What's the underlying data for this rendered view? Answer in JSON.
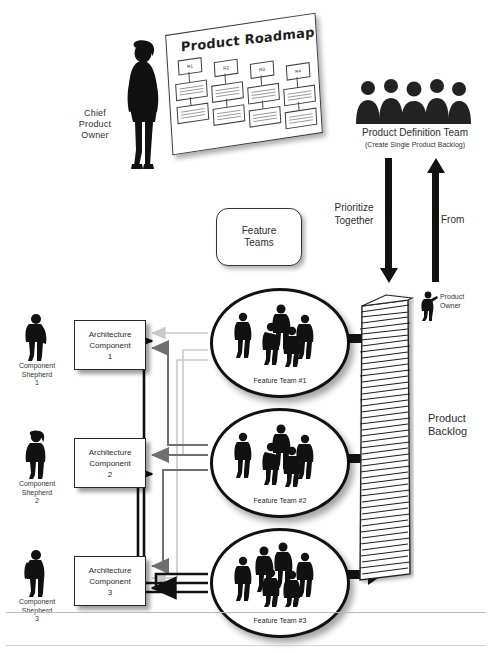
{
  "diagram": {
    "title_text": "Product Roadmap",
    "roadmap": {
      "releases": [
        "R1",
        "R2",
        "R3",
        "R4"
      ]
    },
    "chief_product_owner": {
      "label_line1": "Chief",
      "label_line2": "Product",
      "label_line3": "Owner"
    },
    "product_definition_team": {
      "label": "Product Definition Team",
      "sublabel": "(Create Single Product Backlog)"
    },
    "flow_labels": {
      "prioritize_line1": "Prioritize",
      "prioritize_line2": "Together",
      "from": "From"
    },
    "feature_teams_box": {
      "line1": "Feature",
      "line2": "Teams"
    },
    "feature_teams": [
      {
        "name": "Feature Team #1"
      },
      {
        "name": "Feature Team #2"
      },
      {
        "name": "Feature Team #3"
      }
    ],
    "architecture_components": [
      {
        "line1": "Architecture",
        "line2": "Component",
        "line3": "1"
      },
      {
        "line1": "Architecture",
        "line2": "Component",
        "line3": "2"
      },
      {
        "line1": "Architecture",
        "line2": "Component",
        "line3": "3"
      }
    ],
    "component_shepherds": [
      {
        "line1": "Component",
        "line2": "Shepherd",
        "line3": "1"
      },
      {
        "line1": "Component",
        "line2": "Shepherd",
        "line3": "2"
      },
      {
        "line1": "Component",
        "line2": "Shepherd",
        "line3": "3"
      }
    ],
    "product_backlog": {
      "label_line1": "Product",
      "label_line2": "Backlog"
    },
    "product_owner": {
      "label_line1": "Product",
      "label_line2": "Owner"
    },
    "colors": {
      "ink": "#111111",
      "paper": "#ffffff",
      "wire_light": "#c9c9c9",
      "wire_mid": "#6f6f6f",
      "wire_dark": "#111111"
    }
  }
}
